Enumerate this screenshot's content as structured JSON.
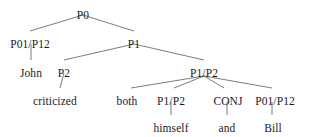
{
  "diagram": {
    "type": "syntax-tree",
    "title": "",
    "stroke_color": "#444444",
    "text_color": "#1a1a1a",
    "background": "#ffffff",
    "sentence": "John criticized both himself and Bill",
    "nodes": [
      {
        "id": "p0",
        "label": "P0",
        "x": 83,
        "y": 9,
        "kind": "category"
      },
      {
        "id": "p01p12_a",
        "label": "P01/P12",
        "x": 30,
        "y": 38,
        "kind": "category"
      },
      {
        "id": "p1",
        "label": "P1",
        "x": 134,
        "y": 38,
        "kind": "category"
      },
      {
        "id": "john",
        "label": "John",
        "x": 31,
        "y": 67,
        "kind": "terminal"
      },
      {
        "id": "p2_a",
        "label": "P2",
        "x": 64,
        "y": 67,
        "kind": "category"
      },
      {
        "id": "p1p2_a",
        "label": "P1/P2",
        "x": 204,
        "y": 67,
        "kind": "category"
      },
      {
        "id": "criticized",
        "label": "criticized",
        "x": 55,
        "y": 95,
        "kind": "terminal"
      },
      {
        "id": "both",
        "label": "both",
        "x": 127,
        "y": 95,
        "kind": "terminal"
      },
      {
        "id": "p1p2_b",
        "label": "P1/P2",
        "x": 171,
        "y": 95,
        "kind": "category"
      },
      {
        "id": "conj",
        "label": "CONJ",
        "x": 228,
        "y": 95,
        "kind": "category"
      },
      {
        "id": "p01p12_b",
        "label": "P01/P12",
        "x": 275,
        "y": 95,
        "kind": "category"
      },
      {
        "id": "himself",
        "label": "himself",
        "x": 171,
        "y": 122,
        "kind": "terminal"
      },
      {
        "id": "and",
        "label": "and",
        "x": 227,
        "y": 122,
        "kind": "terminal"
      },
      {
        "id": "bill",
        "label": "Bill",
        "x": 273,
        "y": 122,
        "kind": "terminal"
      }
    ],
    "edges": [
      {
        "from": "p0",
        "to": "p01p12_a",
        "x1": 83,
        "y1": 15,
        "x2": 30,
        "y2": 31
      },
      {
        "from": "p0",
        "to": "p1",
        "x1": 83,
        "y1": 15,
        "x2": 134,
        "y2": 31
      },
      {
        "from": "p01p12_a",
        "to": "john",
        "x1": 31,
        "y1": 44,
        "x2": 31,
        "y2": 60
      },
      {
        "from": "p1",
        "to": "p2_a",
        "x1": 134,
        "y1": 44,
        "x2": 64,
        "y2": 60
      },
      {
        "from": "p1",
        "to": "p1p2_a",
        "x1": 134,
        "y1": 44,
        "x2": 204,
        "y2": 60
      },
      {
        "from": "p2_a",
        "to": "criticized",
        "x1": 64,
        "y1": 73,
        "x2": 60,
        "y2": 88
      },
      {
        "from": "p1p2_a",
        "to": "both",
        "x1": 204,
        "y1": 76,
        "x2": 131,
        "y2": 88
      },
      {
        "from": "p1p2_a",
        "to": "p1p2_b",
        "x1": 204,
        "y1": 76,
        "x2": 174,
        "y2": 88
      },
      {
        "from": "p1p2_a",
        "to": "conj",
        "x1": 204,
        "y1": 76,
        "x2": 224,
        "y2": 88
      },
      {
        "from": "p1p2_a",
        "to": "p01p12_b",
        "x1": 204,
        "y1": 76,
        "x2": 272,
        "y2": 88
      },
      {
        "from": "p1p2_b",
        "to": "himself",
        "x1": 171,
        "y1": 102,
        "x2": 171,
        "y2": 115
      },
      {
        "from": "conj",
        "to": "and",
        "x1": 227,
        "y1": 102,
        "x2": 227,
        "y2": 115
      },
      {
        "from": "p01p12_b",
        "to": "bill",
        "x1": 272,
        "y1": 102,
        "x2": 272,
        "y2": 115
      }
    ]
  }
}
